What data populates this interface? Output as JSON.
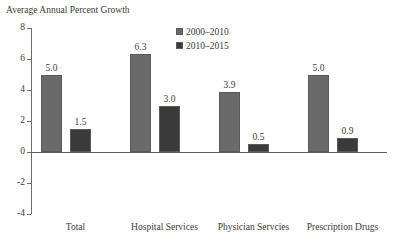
{
  "figure": {
    "running_title": "Exhibit 1. Personal Health Care",
    "caption": "Average Annual Percent Growth"
  },
  "legend": {
    "position": "inside-top-center",
    "entries": [
      {
        "label": "2000–2010",
        "color": "#6a6a6a"
      },
      {
        "label": "2010–2015",
        "color": "#3a3a3a"
      }
    ]
  },
  "chart_data": {
    "type": "bar",
    "title": "Exhibit 1. Personal Health Care",
    "subtitle": "Average Annual Percent Growth",
    "xlabel": "",
    "ylabel": "Average Annual Percent Growth",
    "ylim": [
      -4,
      8
    ],
    "yticks": [
      8,
      6,
      4,
      2,
      0,
      -2,
      -4
    ],
    "ytick_labels": [
      "8",
      "6",
      "4",
      "2",
      "0",
      "-2",
      "-4"
    ],
    "grid": false,
    "legend_position": "inside-top-center",
    "categories": [
      "Total",
      "Hospital Services",
      "Physician Servcies",
      "Prescription Drugs"
    ],
    "series": [
      {
        "name": "2000–2010",
        "color": "#6a6a6a",
        "values": [
          5.0,
          6.3,
          3.9,
          5.0
        ],
        "labels": [
          "5.0",
          "6.3",
          "3.9",
          "5.0"
        ]
      },
      {
        "name": "2010–2015",
        "color": "#3a3a3a",
        "values": [
          1.5,
          3.0,
          0.5,
          0.9
        ],
        "labels": [
          "1.5",
          "3.0",
          "0.5",
          "0.9"
        ]
      }
    ]
  }
}
